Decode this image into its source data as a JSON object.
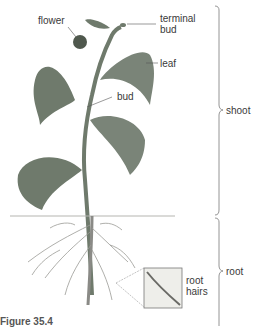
{
  "figure": {
    "caption": "Figure 35.4",
    "labels": {
      "flower": "flower",
      "terminal_bud": "terminal\nbud",
      "leaf": "leaf",
      "bud": "bud",
      "shoot": "shoot",
      "root": "root",
      "root_hairs": "root\nhairs"
    },
    "colors": {
      "leaf": "#6f7a6c",
      "leaf_dark": "#4f584d",
      "stem": "#7a8478",
      "root": "#9a9a96",
      "soil_line": "#b5b5b0",
      "bracket": "#7a7a7a",
      "label": "#3a3a3a"
    }
  }
}
